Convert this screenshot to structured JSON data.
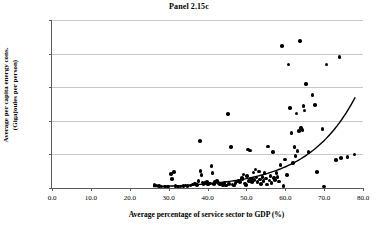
{
  "chart_data": {
    "type": "scatter",
    "title": "Panel 2.15c",
    "xlabel": "Average percentage of service sector to GDP (%)",
    "ylabel_line1": "Average per capita energy cons.",
    "ylabel_line2": "(Gigajoules per person)",
    "xlim": [
      0,
      80
    ],
    "ylim": [
      0,
      500
    ],
    "xticks": [
      0,
      10,
      20,
      30,
      40,
      50,
      60,
      70,
      80
    ],
    "xtick_labels": [
      "0.0",
      "10.0",
      "20.0",
      "30.0",
      "40.0",
      "50.0",
      "60.0",
      "70.0",
      "80.0"
    ],
    "yticks": [
      0,
      100,
      200,
      300,
      400,
      500
    ],
    "ytick_labels": [
      "0",
      "100",
      "200",
      "300",
      "400",
      "500"
    ],
    "grid": "horizontal",
    "legend": "none",
    "marker_color": "#000000",
    "gridline_color": "#c8c8c8",
    "axis_color": "#5a5a5a",
    "series": [
      {
        "name": "Countries",
        "points": [
          [
            26.4,
            9
          ],
          [
            26.9,
            8
          ],
          [
            27.6,
            6
          ],
          [
            28.2,
            5
          ],
          [
            29.0,
            4
          ],
          [
            29.8,
            5
          ],
          [
            30.6,
            42
          ],
          [
            30.9,
            26
          ],
          [
            31.4,
            47
          ],
          [
            31.8,
            6
          ],
          [
            32.4,
            5
          ],
          [
            33.1,
            4
          ],
          [
            33.8,
            6
          ],
          [
            34.3,
            7
          ],
          [
            34.9,
            6
          ],
          [
            35.6,
            8
          ],
          [
            36.2,
            11
          ],
          [
            36.8,
            13
          ],
          [
            37.3,
            9
          ],
          [
            37.7,
            21
          ],
          [
            38.0,
            140
          ],
          [
            38.2,
            50
          ],
          [
            38.5,
            38
          ],
          [
            38.7,
            16
          ],
          [
            39.0,
            12
          ],
          [
            39.4,
            14
          ],
          [
            39.8,
            18
          ],
          [
            40.2,
            10
          ],
          [
            40.6,
            13
          ],
          [
            41.0,
            66
          ],
          [
            41.3,
            45
          ],
          [
            41.7,
            12
          ],
          [
            42.0,
            17
          ],
          [
            42.4,
            20
          ],
          [
            42.8,
            15
          ],
          [
            43.2,
            11
          ],
          [
            43.6,
            13
          ],
          [
            44.0,
            9
          ],
          [
            44.4,
            14
          ],
          [
            44.8,
            7
          ],
          [
            45.2,
            221
          ],
          [
            45.6,
            12
          ],
          [
            46.0,
            122
          ],
          [
            46.4,
            10
          ],
          [
            46.8,
            8
          ],
          [
            47.2,
            15
          ],
          [
            47.6,
            19
          ],
          [
            48.0,
            22
          ],
          [
            48.4,
            17
          ],
          [
            48.8,
            30
          ],
          [
            49.0,
            26
          ],
          [
            49.3,
            40
          ],
          [
            49.6,
            13
          ],
          [
            49.9,
            9
          ],
          [
            50.2,
            36
          ],
          [
            50.4,
            114
          ],
          [
            50.7,
            21
          ],
          [
            51.0,
            112
          ],
          [
            51.2,
            28
          ],
          [
            51.5,
            17
          ],
          [
            51.8,
            46
          ],
          [
            52.0,
            24
          ],
          [
            52.3,
            55
          ],
          [
            52.6,
            31
          ],
          [
            52.9,
            18
          ],
          [
            53.2,
            49
          ],
          [
            53.5,
            25
          ],
          [
            53.8,
            12
          ],
          [
            54.1,
            33
          ],
          [
            54.4,
            20
          ],
          [
            54.7,
            44
          ],
          [
            55.0,
            28
          ],
          [
            55.3,
            10
          ],
          [
            55.6,
            123
          ],
          [
            55.9,
            22
          ],
          [
            56.2,
            35
          ],
          [
            56.5,
            15
          ],
          [
            56.8,
            107
          ],
          [
            57.1,
            29
          ],
          [
            57.4,
            24
          ],
          [
            57.7,
            45
          ],
          [
            58.0,
            32
          ],
          [
            58.4,
            19
          ],
          [
            58.8,
            68
          ],
          [
            59.2,
            422
          ],
          [
            59.6,
            6
          ],
          [
            60.0,
            85
          ],
          [
            60.4,
            39
          ],
          [
            60.8,
            367
          ],
          [
            61.2,
            238
          ],
          [
            61.6,
            163
          ],
          [
            62.0,
            74
          ],
          [
            62.4,
            122
          ],
          [
            62.6,
            96
          ],
          [
            62.9,
            222
          ],
          [
            63.2,
            110
          ],
          [
            63.5,
            169
          ],
          [
            63.8,
            437
          ],
          [
            64.1,
            178
          ],
          [
            64.4,
            172
          ],
          [
            64.7,
            244
          ],
          [
            65.0,
            231
          ],
          [
            65.4,
            310
          ],
          [
            66.0,
            107
          ],
          [
            67.0,
            276
          ],
          [
            67.6,
            247
          ],
          [
            68.2,
            47
          ],
          [
            69.6,
            175
          ],
          [
            69.9,
            4
          ],
          [
            70.6,
            367
          ],
          [
            73.0,
            84
          ],
          [
            74.0,
            389
          ],
          [
            74.4,
            90
          ],
          [
            76.0,
            92
          ],
          [
            77.8,
            100
          ]
        ]
      }
    ],
    "trendline": {
      "type": "exponential",
      "x_start": 26.0,
      "x_end": 78.0,
      "y_start": 4,
      "y_end": 270,
      "description": "fitted exponential trend curve"
    }
  }
}
